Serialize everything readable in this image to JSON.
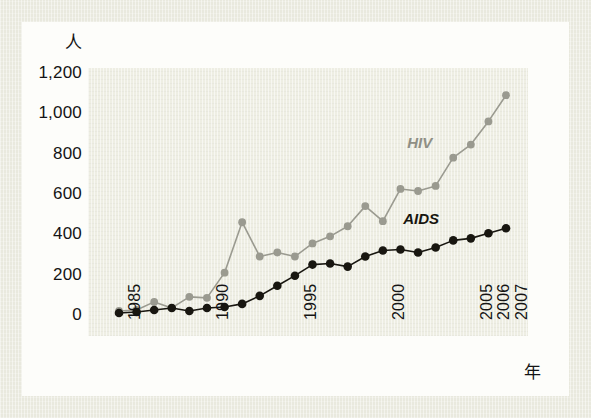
{
  "axes": {
    "y_unit_label": "人",
    "x_unit_label": "年",
    "y_ticks": [
      "1,200",
      "1,000",
      "800",
      "600",
      "400",
      "200",
      "0"
    ],
    "x_ticks": [
      "1985",
      "1990",
      "1995",
      "2000",
      "2005",
      "2006",
      "2007"
    ]
  },
  "series_labels": {
    "hiv": "HIV",
    "aids": "AIDS"
  },
  "colors": {
    "hiv": "#9a9a90",
    "aids": "#181610",
    "plot_background": "#eeeee3",
    "page_background": "#fdfdfa",
    "frame_background": "#e9e9de",
    "text": "#141414"
  },
  "chart_data": {
    "type": "line",
    "title": "",
    "xlabel": "年",
    "ylabel": "人",
    "ylim": [
      0,
      1200
    ],
    "xlim": [
      1985,
      2007
    ],
    "grid": false,
    "legend": "inline-annotation",
    "x": [
      1985,
      1986,
      1987,
      1988,
      1989,
      1990,
      1991,
      1992,
      1993,
      1994,
      1995,
      1996,
      1997,
      1998,
      1999,
      2000,
      2001,
      2002,
      2003,
      2004,
      2005,
      2006,
      2007
    ],
    "categories": [
      "1985",
      "1986",
      "1987",
      "1988",
      "1989",
      "1990",
      "1991",
      "1992",
      "1993",
      "1994",
      "1995",
      "1996",
      "1997",
      "1998",
      "1999",
      "2000",
      "2001",
      "2002",
      "2003",
      "2004",
      "2005",
      "2006",
      "2007"
    ],
    "series": [
      {
        "name": "HIV",
        "color": "#9a9a90",
        "values": [
          20,
          25,
          65,
          35,
          90,
          85,
          210,
          460,
          290,
          310,
          290,
          355,
          390,
          440,
          540,
          465,
          625,
          615,
          640,
          780,
          845,
          960,
          1090
        ]
      },
      {
        "name": "AIDS",
        "color": "#181610",
        "values": [
          10,
          15,
          25,
          35,
          20,
          35,
          40,
          55,
          95,
          145,
          195,
          250,
          255,
          240,
          290,
          320,
          325,
          310,
          335,
          370,
          380,
          405,
          430
        ]
      }
    ]
  }
}
